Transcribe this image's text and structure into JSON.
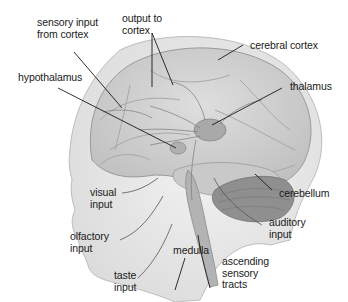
{
  "diagram": {
    "type": "anatomical-illustration",
    "background": "#ffffff",
    "colors": {
      "skin": "#e9e9e9",
      "brain": "#d4d4d4",
      "brain_shadow": "#b8b8b8",
      "thalamus": "#a9a9a9",
      "cerebellum": "#8f8f8f",
      "line": "#1a1a1a",
      "pathway": "#7a7a7a"
    },
    "labels": {
      "sensory_input_from_cortex": "sensory input\nfrom cortex",
      "output_to_cortex": "output to\ncortex",
      "cerebral_cortex": "cerebral cortex",
      "hypothalamus": "hypothalamus",
      "thalamus": "thalamus",
      "visual_input": "visual\ninput",
      "cerebellum": "cerebellum",
      "auditory_input": "auditory\ninput",
      "olfactory_input": "olfactory\ninput",
      "medulla": "medulla",
      "ascending_sensory_tracts": "ascending\nsensory\ntracts",
      "taste_input": "taste\ninput"
    }
  }
}
